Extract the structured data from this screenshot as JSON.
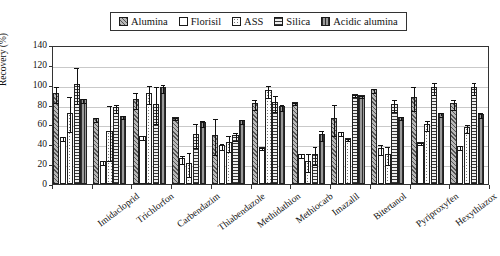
{
  "legend": {
    "position": "top-center",
    "items": [
      {
        "label": "Alumina",
        "pattern": "diagonal-hatch-gray"
      },
      {
        "label": "Florisil",
        "pattern": "white-empty"
      },
      {
        "label": "ASS",
        "pattern": "dotted-white"
      },
      {
        "label": "Silica",
        "pattern": "horizontal-lines"
      },
      {
        "label": "Acidic alumina",
        "pattern": "vertical-lines-dark"
      }
    ]
  },
  "chart_data": {
    "type": "bar",
    "title": "",
    "subtitle": "",
    "xlabel": "",
    "ylabel": "Recovery (%)",
    "ylim": [
      0,
      140
    ],
    "yticks": [
      0,
      20,
      40,
      60,
      80,
      100,
      120,
      140
    ],
    "grid": true,
    "grid_axis": "y",
    "categories": [
      "Imidacloprid",
      "Trichlorfon",
      "Carbendazim",
      "Thiabendazole",
      "Methidathion",
      "Methiocarb",
      "Imazalil",
      "Bitertanol",
      "Pyriproxyfen",
      "Hexythiazox",
      ""
    ],
    "series": [
      {
        "name": "Alumina",
        "values": [
          92,
          66,
          86,
          67,
          49,
          82,
          83,
          66,
          96,
          88,
          82
        ],
        "errors": [
          8,
          2,
          8,
          1,
          18,
          5,
          1,
          16,
          2,
          12,
          5
        ]
      },
      {
        "name": "Florisil",
        "values": [
          47,
          23,
          48,
          26,
          39,
          37,
          30,
          52,
          36,
          42,
          38
        ],
        "errors": [
          2,
          2,
          2,
          4,
          3,
          1,
          2,
          2,
          5,
          1,
          2
        ]
      },
      {
        "name": "ASS",
        "values": [
          72,
          53,
          92,
          21,
          42,
          95,
          23,
          46,
          30,
          60,
          57
        ]
      },
      {
        "name": "ASS_errors",
        "values": [
          18,
          28,
          9,
          12,
          8,
          6,
          9,
          1,
          9,
          5,
          4
        ]
      },
      {
        "name": "Silica",
        "values": [
          101,
          78,
          81,
          50,
          49,
          83,
          30,
          91,
          81,
          98,
          98
        ],
        "errors": [
          18,
          4,
          19,
          12,
          4,
          8,
          9,
          1,
          6,
          6,
          6
        ]
      },
      {
        "name": "Acidic alumina",
        "values": [
          86,
          69,
          98,
          62,
          64,
          79,
          50,
          90,
          68,
          72,
          71
        ],
        "errors": [
          2,
          2,
          4,
          3,
          2,
          3,
          5,
          1,
          2,
          2,
          3
        ]
      }
    ]
  }
}
